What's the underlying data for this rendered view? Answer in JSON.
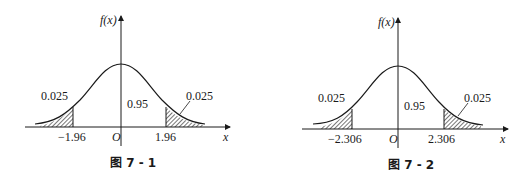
{
  "figures": [
    {
      "caption": "图 7 - 1",
      "y_axis_label": "f(x)",
      "x_axis_label": "x",
      "origin_label": "O",
      "left_crit": "−1.96",
      "right_crit": "1.96",
      "left_tail_prob": "0.025",
      "center_prob": "0.95",
      "right_tail_prob": "0.025"
    },
    {
      "caption": "图 7 - 2",
      "y_axis_label": "f(x)",
      "x_axis_label": "x",
      "origin_label": "O",
      "left_crit": "−2.306",
      "right_crit": "2.306",
      "left_tail_prob": "0.025",
      "center_prob": "0.95",
      "right_tail_prob": "0.025"
    }
  ],
  "colors": {
    "ink": "#1a1a1a",
    "background": "#ffffff"
  }
}
